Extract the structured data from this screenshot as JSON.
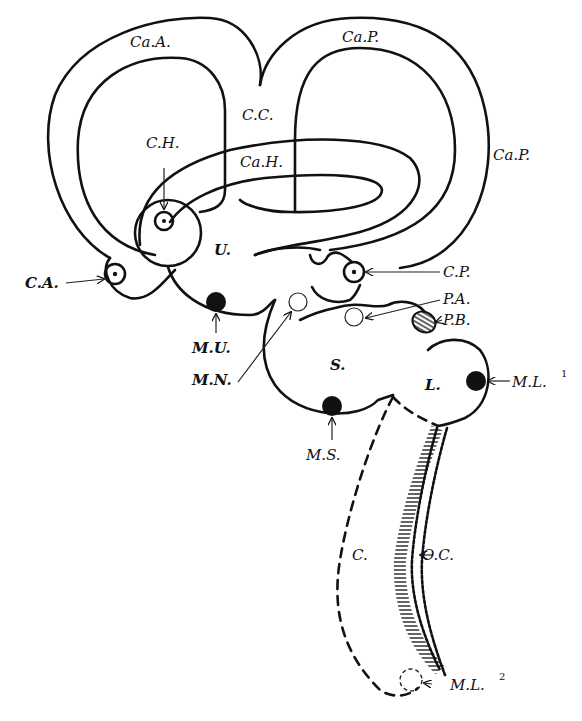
{
  "figure": {
    "labels": {
      "ca_a": "Ca.A.",
      "ca_p_top": "Ca.P.",
      "ca_p_right": "Ca.P.",
      "c_c": "C.C.",
      "c_h": "C.H.",
      "ca_h": "Ca.H.",
      "u": "U.",
      "c_a": "C.A.",
      "c_p": "C.P.",
      "m_u": "M.U.",
      "m_n": "M.N.",
      "p_a": "P.A.",
      "p_b": "P.B.",
      "s": "S.",
      "l": "L.",
      "m_l1": "M.L.",
      "m_l1_sup": "1",
      "m_s": "M.S.",
      "c": "C.",
      "o_c": "O.C.",
      "m_l2": "M.L.",
      "m_l2_sup": "2"
    },
    "colors": {
      "ink": "#111111",
      "paper": "#ffffff"
    }
  }
}
